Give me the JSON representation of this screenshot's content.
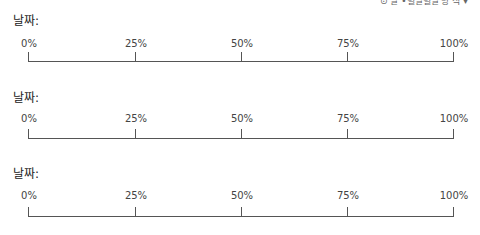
{
  "header": {
    "cut_text": "⊙ 날 •별날별날 방 식 ▾"
  },
  "scales": [
    {
      "date_label": "날짜:",
      "ticks": [
        "0%",
        "25%",
        "50%",
        "75%",
        "100%"
      ]
    },
    {
      "date_label": "날짜:",
      "ticks": [
        "0%",
        "25%",
        "50%",
        "75%",
        "100%"
      ]
    },
    {
      "date_label": "날짜:",
      "ticks": [
        "0%",
        "25%",
        "50%",
        "75%",
        "100%"
      ]
    }
  ]
}
